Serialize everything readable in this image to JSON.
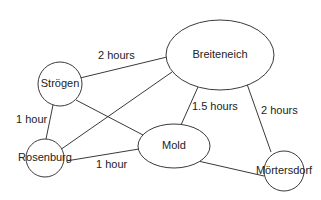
{
  "diagram": {
    "type": "graph",
    "colors": {
      "stroke": "#3a3a3a",
      "text": "#222222",
      "background": "#ffffff"
    },
    "nodes": [
      {
        "id": "breiteneich",
        "label": "Breiteneich",
        "shape": "ellipse",
        "cx": 220,
        "cy": 55,
        "rx": 54,
        "ry": 35
      },
      {
        "id": "strogen",
        "label": "Strögen",
        "shape": "circle",
        "cx": 60,
        "cy": 84,
        "rx": 22,
        "ry": 22
      },
      {
        "id": "rosenburg",
        "label": "Rosenburg",
        "shape": "circle",
        "cx": 45,
        "cy": 158,
        "rx": 19,
        "ry": 19
      },
      {
        "id": "mold",
        "label": "Mold",
        "shape": "ellipse",
        "cx": 174,
        "cy": 146,
        "rx": 36,
        "ry": 22
      },
      {
        "id": "mortersdorf",
        "label": "Mörtersdorf",
        "shape": "circle",
        "cx": 284,
        "cy": 171,
        "rx": 20,
        "ry": 20
      }
    ],
    "edges": [
      {
        "from": "strogen",
        "to": "breiteneich",
        "x1": 80,
        "y1": 78,
        "x2": 167,
        "y2": 57,
        "label": "2 hours",
        "lx": 98,
        "ly": 59
      },
      {
        "from": "strogen",
        "to": "rosenburg",
        "x1": 53,
        "y1": 105,
        "x2": 46,
        "y2": 139,
        "label": "1 hour",
        "lx": 16,
        "ly": 123
      },
      {
        "from": "strogen",
        "to": "mold",
        "x1": 76,
        "y1": 100,
        "x2": 143,
        "y2": 135,
        "label": "",
        "lx": 0,
        "ly": 0
      },
      {
        "from": "rosenburg",
        "to": "breiteneich",
        "x1": 60,
        "y1": 150,
        "x2": 172,
        "y2": 72,
        "label": "",
        "lx": 0,
        "ly": 0
      },
      {
        "from": "rosenburg",
        "to": "mold",
        "x1": 66,
        "y1": 161,
        "x2": 139,
        "y2": 149,
        "label": "1 hour",
        "lx": 96,
        "ly": 168
      },
      {
        "from": "breiteneich",
        "to": "mold",
        "x1": 198,
        "y1": 87,
        "x2": 181,
        "y2": 125,
        "label": "1.5 hours",
        "lx": 192,
        "ly": 110
      },
      {
        "from": "breiteneich",
        "to": "mortersdorf",
        "x1": 247,
        "y1": 84,
        "x2": 271,
        "y2": 152,
        "label": "2 hours",
        "lx": 261,
        "ly": 114
      },
      {
        "from": "mold",
        "to": "mortersdorf",
        "x1": 198,
        "y1": 161,
        "x2": 264,
        "y2": 176,
        "label": "",
        "lx": 0,
        "ly": 0
      }
    ]
  }
}
